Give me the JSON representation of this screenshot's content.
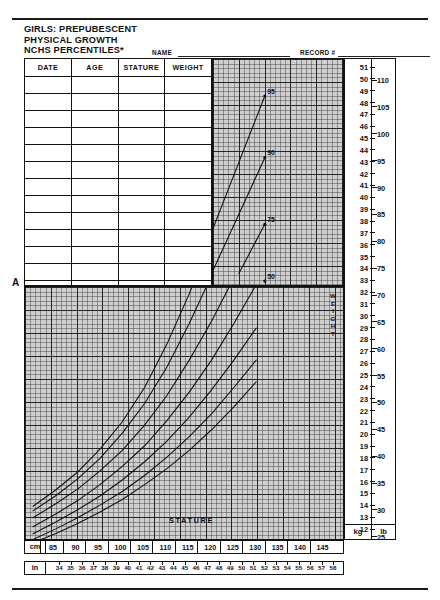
{
  "header": {
    "title_lines": [
      "GIRLS: PREPUBESCENT",
      "PHYSICAL GROWTH",
      "NCHS PERCENTILES*"
    ],
    "name_label": "NAME",
    "record_label": "RECORD #"
  },
  "record_table": {
    "columns": [
      "DATE",
      "AGE",
      "STATURE",
      "WEIGHT"
    ],
    "empty_row_count": 14
  },
  "marker": {
    "label": "A"
  },
  "axes": {
    "stature_label": "STATURE",
    "weight_label_vertical": [
      "W",
      "E",
      "I",
      "G",
      "H",
      "T"
    ],
    "weight_unit_primary": "kg",
    "weight_unit_secondary": "lb",
    "stature_unit_primary": "cm",
    "stature_unit_secondary": "in",
    "weight_kg_ticks": [
      51,
      50,
      49,
      48,
      47,
      46,
      45,
      44,
      43,
      42,
      41,
      40,
      39,
      38,
      37,
      36,
      35,
      34,
      33,
      32,
      31,
      30,
      29,
      28,
      27,
      26,
      25,
      24,
      23,
      22,
      21,
      20,
      19,
      18,
      17,
      16,
      15,
      14,
      13,
      12
    ],
    "weight_lb_ticks": [
      110,
      105,
      100,
      95,
      90,
      85,
      80,
      75,
      70,
      65,
      60,
      55,
      50,
      45,
      40,
      35,
      30,
      25
    ],
    "stature_cm_ticks": [
      85,
      90,
      95,
      100,
      105,
      110,
      115,
      120,
      125,
      130,
      135,
      140,
      145
    ],
    "stature_in_ticks": [
      34,
      35,
      36,
      37,
      38,
      39,
      40,
      41,
      42,
      43,
      44,
      45,
      46,
      47,
      48,
      49,
      50,
      51,
      52,
      53,
      54,
      55,
      56,
      57,
      58
    ]
  },
  "chart_data": {
    "type": "line",
    "title": "GIRLS: PREPUBESCENT PHYSICAL GROWTH NCHS PERCENTILES",
    "xlabel": "STATURE",
    "ylabel": "WEIGHT",
    "xlim_cm": [
      85,
      150
    ],
    "ylim_kg": [
      11.5,
      51.5
    ],
    "grid": true,
    "legend": "curve-end labels",
    "x_unit": "cm",
    "y_unit": "kg",
    "series": [
      {
        "name": "95th",
        "label": "95",
        "x": [
          85,
          90,
          95,
          100,
          105,
          110,
          115,
          120,
          125,
          130,
          135
        ],
        "y": [
          14.2,
          15.6,
          17.2,
          19.2,
          21.6,
          24.6,
          28.4,
          32.8,
          37.8,
          43.2,
          48.6
        ]
      },
      {
        "name": "90th",
        "label": "90",
        "x": [
          85,
          90,
          95,
          100,
          105,
          110,
          115,
          120,
          125,
          130,
          135
        ],
        "y": [
          13.8,
          15.1,
          16.6,
          18.4,
          20.6,
          23.2,
          26.4,
          30.2,
          34.4,
          39.0,
          43.6
        ]
      },
      {
        "name": "75th",
        "label": "75",
        "x": [
          85,
          90,
          95,
          100,
          105,
          110,
          115,
          120,
          125,
          130,
          135
        ],
        "y": [
          13.2,
          14.4,
          15.7,
          17.3,
          19.1,
          21.3,
          23.9,
          27.0,
          30.4,
          34.2,
          38.2
        ]
      },
      {
        "name": "50th",
        "label": "50",
        "x": [
          85,
          90,
          95,
          100,
          105,
          110,
          115,
          120,
          125,
          130,
          135
        ],
        "y": [
          12.4,
          13.5,
          14.7,
          16.1,
          17.7,
          19.5,
          21.7,
          24.2,
          27.0,
          30.2,
          33.6
        ]
      },
      {
        "name": "25th",
        "label": "25",
        "x": [
          85,
          90,
          95,
          100,
          105,
          110,
          115,
          120,
          125,
          130,
          135
        ],
        "y": [
          11.8,
          12.8,
          13.9,
          15.1,
          16.5,
          18.1,
          19.9,
          22.0,
          24.4,
          27.0,
          29.8
        ]
      },
      {
        "name": "10th",
        "label": "10",
        "x": [
          85,
          90,
          95,
          100,
          105,
          110,
          115,
          120,
          125,
          130,
          135
        ],
        "y": [
          11.3,
          12.2,
          13.2,
          14.3,
          15.5,
          16.9,
          18.5,
          20.3,
          22.3,
          24.6,
          27.0
        ]
      },
      {
        "name": "5th",
        "label": "5",
        "x": [
          85,
          90,
          95,
          100,
          105,
          110,
          115,
          120,
          125,
          130,
          135
        ],
        "y": [
          11.0,
          11.8,
          12.7,
          13.7,
          14.8,
          16.1,
          17.5,
          19.1,
          20.9,
          22.9,
          25.1
        ]
      }
    ]
  },
  "footnote": {
    "text": ""
  },
  "colors": {
    "ink": "#111111",
    "grid_bold": "#141414",
    "grid_fine": "#3c3c3c",
    "paper": "#ffffff",
    "grid_bg": "#cfcfcf"
  }
}
